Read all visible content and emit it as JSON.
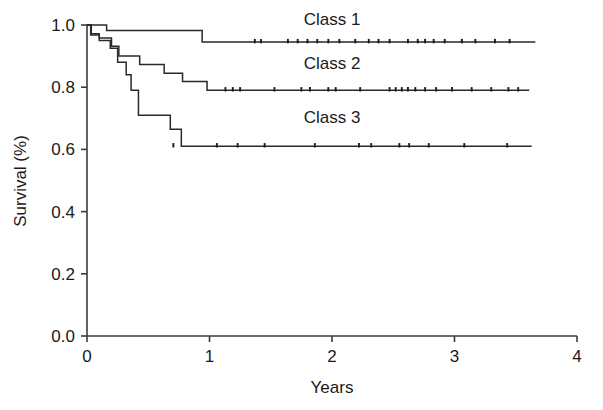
{
  "chart_data": {
    "type": "line",
    "title": "",
    "subtitle": "",
    "xlabel": "Years",
    "ylabel": "Survival (%)",
    "xlim": [
      0,
      4
    ],
    "ylim": [
      0.0,
      1.0
    ],
    "xticks": [
      0,
      1,
      2,
      3,
      4
    ],
    "xtick_labels": [
      "0",
      "1",
      "2",
      "3",
      "4"
    ],
    "yticks": [
      0.0,
      0.2,
      0.4,
      0.6,
      0.8,
      1.0
    ],
    "ytick_labels": [
      "0.0",
      "0.2",
      "0.4",
      "0.6",
      "0.8",
      "1.0"
    ],
    "grid": false,
    "legend_position": "inline-right-of-curve",
    "curve_style": "kaplan-meier-step",
    "series": [
      {
        "name": "Class 1",
        "label": "Class 1",
        "color": "#2a2a2a",
        "label_x": 2.0,
        "label_y": 1.0,
        "final_survival": 0.945,
        "steps": [
          {
            "x": 0.0,
            "y": 1.0
          },
          {
            "x": 0.16,
            "y": 1.0
          },
          {
            "x": 0.16,
            "y": 0.982
          },
          {
            "x": 0.94,
            "y": 0.982
          },
          {
            "x": 0.94,
            "y": 0.945
          },
          {
            "x": 3.66,
            "y": 0.945
          }
        ],
        "censor_times": [
          1.37,
          1.42,
          1.64,
          1.72,
          1.8,
          1.88,
          1.97,
          2.06,
          2.19,
          2.3,
          2.38,
          2.47,
          2.62,
          2.7,
          2.76,
          2.83,
          2.92,
          3.06,
          3.17,
          3.33,
          3.45
        ]
      },
      {
        "name": "Class 2",
        "label": "Class 2",
        "color": "#2a2a2a",
        "label_x": 2.0,
        "label_y": 0.86,
        "final_survival": 0.79,
        "steps": [
          {
            "x": 0.0,
            "y": 1.0
          },
          {
            "x": 0.035,
            "y": 1.0
          },
          {
            "x": 0.035,
            "y": 0.972
          },
          {
            "x": 0.1,
            "y": 0.972
          },
          {
            "x": 0.1,
            "y": 0.958
          },
          {
            "x": 0.2,
            "y": 0.958
          },
          {
            "x": 0.2,
            "y": 0.932
          },
          {
            "x": 0.26,
            "y": 0.932
          },
          {
            "x": 0.26,
            "y": 0.9
          },
          {
            "x": 0.43,
            "y": 0.9
          },
          {
            "x": 0.43,
            "y": 0.873
          },
          {
            "x": 0.63,
            "y": 0.873
          },
          {
            "x": 0.63,
            "y": 0.845
          },
          {
            "x": 0.78,
            "y": 0.845
          },
          {
            "x": 0.78,
            "y": 0.818
          },
          {
            "x": 0.98,
            "y": 0.818
          },
          {
            "x": 0.98,
            "y": 0.79
          },
          {
            "x": 3.61,
            "y": 0.79
          }
        ],
        "censor_times": [
          1.13,
          1.19,
          1.25,
          1.53,
          1.75,
          1.82,
          1.97,
          2.03,
          2.23,
          2.47,
          2.52,
          2.57,
          2.62,
          2.68,
          2.76,
          2.85,
          2.98,
          3.14,
          3.3,
          3.44,
          3.52
        ]
      },
      {
        "name": "Class 3",
        "label": "Class 3",
        "color": "#2a2a2a",
        "label_x": 2.0,
        "label_y": 0.685,
        "final_survival": 0.61,
        "steps": [
          {
            "x": 0.0,
            "y": 1.0
          },
          {
            "x": 0.03,
            "y": 1.0
          },
          {
            "x": 0.03,
            "y": 0.968
          },
          {
            "x": 0.1,
            "y": 0.968
          },
          {
            "x": 0.1,
            "y": 0.95
          },
          {
            "x": 0.19,
            "y": 0.95
          },
          {
            "x": 0.19,
            "y": 0.925
          },
          {
            "x": 0.25,
            "y": 0.925
          },
          {
            "x": 0.25,
            "y": 0.88
          },
          {
            "x": 0.32,
            "y": 0.88
          },
          {
            "x": 0.32,
            "y": 0.84
          },
          {
            "x": 0.36,
            "y": 0.84
          },
          {
            "x": 0.36,
            "y": 0.79
          },
          {
            "x": 0.42,
            "y": 0.79
          },
          {
            "x": 0.42,
            "y": 0.71
          },
          {
            "x": 0.68,
            "y": 0.71
          },
          {
            "x": 0.68,
            "y": 0.665
          },
          {
            "x": 0.77,
            "y": 0.665
          },
          {
            "x": 0.77,
            "y": 0.61
          },
          {
            "x": 3.63,
            "y": 0.61
          }
        ],
        "censor_times": [
          0.705,
          1.06,
          1.23,
          1.45,
          1.86,
          2.22,
          2.32,
          2.55,
          2.63,
          2.79,
          3.08,
          3.43
        ]
      }
    ]
  },
  "axes": {
    "y_axis_title": "Survival (%)",
    "x_axis_title": "Years"
  }
}
